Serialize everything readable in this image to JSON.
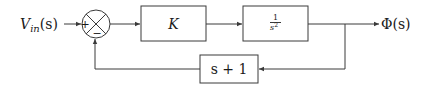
{
  "diagram": {
    "type": "feedback-control-block-diagram",
    "input": {
      "label": "V",
      "subscript": "in",
      "arg": "(s)"
    },
    "output": {
      "label": "Φ(s)"
    },
    "summing_junction": {
      "top_sign": "+",
      "bottom_sign": "−"
    },
    "forward_blocks": [
      {
        "id": "gain",
        "label": "K"
      },
      {
        "id": "plant",
        "numerator": "1",
        "denominator": "s",
        "denominator_exponent": "2"
      }
    ],
    "feedback_block": {
      "id": "feedback",
      "label": "s + 1"
    },
    "colors": {
      "line": "#3a3a3a",
      "text": "#1a1a1a",
      "background": "#ffffff"
    }
  }
}
